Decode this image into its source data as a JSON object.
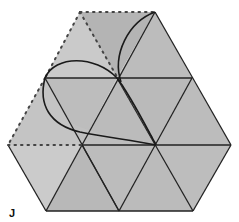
{
  "figure": {
    "label": "J",
    "colors": {
      "fill_main": "#b9b9b9",
      "fill_light": "#c9c9c9",
      "fill_dark": "#b2b2b2",
      "line": "#222222",
      "dotted": "#444444",
      "background": "#ffffff"
    }
  }
}
